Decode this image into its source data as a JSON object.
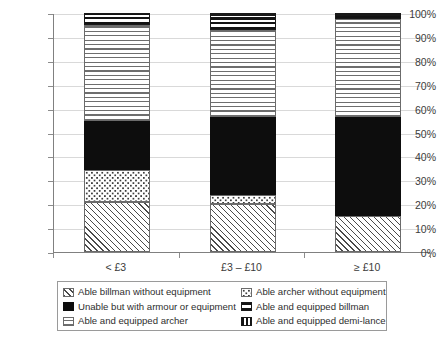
{
  "chart_data": {
    "type": "bar",
    "stacked": true,
    "title": "",
    "xlabel": "",
    "ylabel": "",
    "ylim": [
      0,
      100
    ],
    "ytick_labels": [
      "100%",
      "90%",
      "80%",
      "70%",
      "60%",
      "50%",
      "40%",
      "30%",
      "20%",
      "10%",
      "0%"
    ],
    "ytick_values": [
      100,
      90,
      80,
      70,
      60,
      50,
      40,
      30,
      20,
      10,
      0
    ],
    "grid": true,
    "legend_position": "bottom",
    "categories": [
      "< £3",
      "£3 – £10",
      "≥ £10"
    ],
    "series": [
      {
        "name": "Able billman without equipment",
        "pattern": "diagonal-hatch",
        "values": [
          21.0,
          20.0,
          15.0
        ]
      },
      {
        "name": "Able archer without equipment",
        "pattern": "dotted",
        "values": [
          13.5,
          4.0,
          0.0
        ]
      },
      {
        "name": "Unable but with armour or equipment",
        "pattern": "solid-black",
        "values": [
          20.5,
          32.5,
          41.5
        ]
      },
      {
        "name": "Able and equipped archer",
        "pattern": "light-horizontal",
        "values": [
          40.0,
          36.5,
          41.0
        ]
      },
      {
        "name": "Able and equipped billman",
        "pattern": "heavy-horizontal",
        "values": [
          5.0,
          6.0,
          1.5
        ]
      },
      {
        "name": "Able and equipped demi-lance",
        "pattern": "vertical-bars",
        "values": [
          0.0,
          1.0,
          1.0
        ]
      }
    ]
  },
  "legend": {
    "items": [
      {
        "label": "Able billman without equipment",
        "swatch": "diagonal-hatch-swatch"
      },
      {
        "label": "Able archer without equipment",
        "swatch": "dotted-swatch"
      },
      {
        "label": "Unable but with armour or equipment",
        "swatch": "solid-black-swatch"
      },
      {
        "label": "Able and equipped billman",
        "swatch": "heavy-horizontal-swatch"
      },
      {
        "label": "Able and equipped archer",
        "swatch": "light-horizontal-swatch"
      },
      {
        "label": "Able and equipped demi-lance",
        "swatch": "vertical-bars-swatch"
      }
    ]
  },
  "colors": {
    "solid": "#0d0d0d",
    "pattern_stroke": "#4a4a4a",
    "gridline": "#d9d9d9",
    "axis": "#808080",
    "text": "#3b3b3b"
  }
}
